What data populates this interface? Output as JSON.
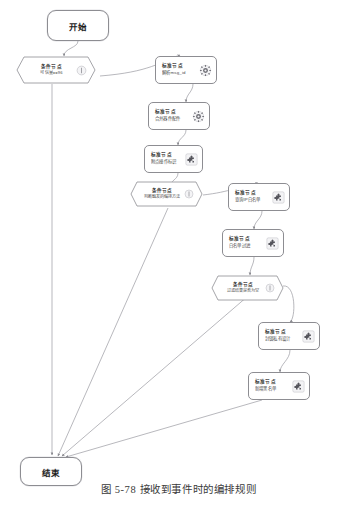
{
  "figure": {
    "caption": "图 5-78 接收到事件时的编排规则"
  },
  "palette": {
    "stroke": "#8d8d92",
    "edge": "#9a9aa0",
    "text": "#2b2b2b",
    "background": "#ffffff",
    "icon_gear": "#6f6f76",
    "icon_puzzle": "#55555c"
  },
  "flow": {
    "start": {
      "label": "开始",
      "type": "terminator"
    },
    "end": {
      "label": "结束",
      "type": "terminator"
    },
    "nodes": [
      {
        "id": "cond-can-arrange",
        "type": "condition",
        "kind": "条件节点",
        "title": "条件节点",
        "detail": "可信量==96",
        "icon": "condition-icon"
      },
      {
        "id": "std-parse-msg",
        "type": "standard",
        "kind": "标准节点",
        "title": "标准节点",
        "detail": "解析msg_id",
        "icon": "gear-icon"
      },
      {
        "id": "std-query-source",
        "type": "standard",
        "kind": "标准节点",
        "title": "标准节点",
        "detail": "合并器件配件",
        "icon": "gear-icon"
      },
      {
        "id": "std-node-tag",
        "type": "standard",
        "kind": "标准节点",
        "title": "标准节点",
        "detail": "附点操作标识",
        "icon": "puzzle-icon"
      },
      {
        "id": "cond-has-rule",
        "type": "condition",
        "kind": "条件节点",
        "title": "条件节点",
        "detail": "判断触发的编排方法",
        "icon": "condition-icon"
      },
      {
        "id": "std-query-whitelist",
        "type": "standard",
        "kind": "标准节点",
        "title": "标准节点",
        "detail": "查询IP白名单",
        "icon": "puzzle-icon"
      },
      {
        "id": "std-filter-whitelist",
        "type": "standard",
        "kind": "标准节点",
        "title": "标准节点",
        "detail": "白名单过滤",
        "icon": "puzzle-icon"
      },
      {
        "id": "cond-need-block",
        "type": "condition",
        "kind": "条件节点",
        "title": "条件节点",
        "detail": "过滤结果是否为空",
        "icon": "condition-icon"
      },
      {
        "id": "std-block-mark",
        "type": "standard",
        "kind": "标准节点",
        "title": "标准节点",
        "detail": "封锁私有设计",
        "icon": "puzzle-icon"
      },
      {
        "id": "std-update-blacklist",
        "type": "standard",
        "kind": "标准节点",
        "title": "标准节点",
        "detail": "新增黑名单",
        "icon": "puzzle-icon"
      }
    ]
  }
}
